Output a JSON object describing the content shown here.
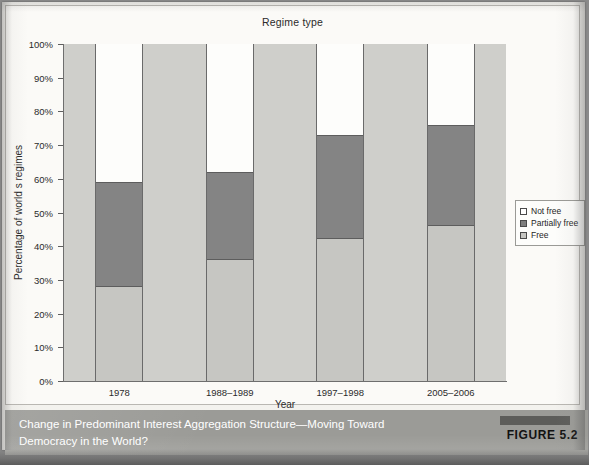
{
  "chart": {
    "title": "Regime type",
    "ylabel": "Percentage of world s regimes",
    "xlabel": "Year"
  },
  "y_ticks": [
    "0%",
    "10%",
    "20%",
    "30%",
    "40%",
    "50%",
    "60%",
    "70%",
    "80%",
    "90%",
    "100%"
  ],
  "legend": {
    "items": [
      {
        "label": "Not free",
        "swatch": "swatch-white"
      },
      {
        "label": "Partially free",
        "swatch": "swatch-dark-gray"
      },
      {
        "label": "Free",
        "swatch": "swatch-light-gray"
      }
    ]
  },
  "caption": {
    "text": "Change in Predominant Interest Aggregation Structure—Moving Toward Democracy in the World?",
    "figure_label": "FIGURE 5.2"
  },
  "colors": {
    "not_free": "#ffffff",
    "partially_free": "#848484",
    "free": "#c6c6c2",
    "plot_background": "#cfcfcb",
    "caption_band": "#9b9b97"
  },
  "chart_data": {
    "type": "bar",
    "stacked": true,
    "normalized_percent": true,
    "title": "Regime type",
    "xlabel": "Year",
    "ylabel": "Percentage of world s regimes",
    "ylim": [
      0,
      100
    ],
    "ytick_step": 10,
    "grid": false,
    "legend_position": "right",
    "categories": [
      "1978",
      "1988–1989",
      "1997–1998",
      "2005–2006"
    ],
    "series": [
      {
        "name": "Free",
        "values": [
          28,
          36,
          42,
          46
        ]
      },
      {
        "name": "Partially free",
        "values": [
          31,
          26,
          31,
          30
        ]
      },
      {
        "name": "Not free",
        "values": [
          41,
          38,
          27,
          24
        ]
      }
    ],
    "cumulative_tops": {
      "free": [
        28,
        36,
        42,
        46
      ],
      "partially_free": [
        59,
        62,
        73,
        76
      ],
      "not_free": [
        100,
        100,
        100,
        100
      ]
    }
  }
}
